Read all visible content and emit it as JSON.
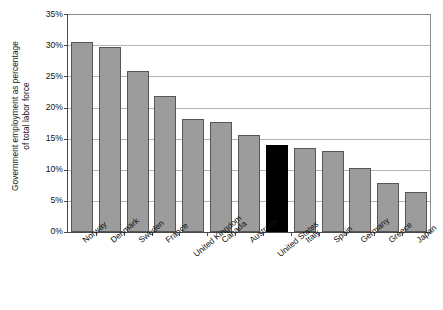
{
  "chart_data": {
    "type": "bar",
    "title": "",
    "subtitle": "",
    "xlabel": "",
    "ylabel": "Government employment as percentage\nof total labor force",
    "categories": [
      "Norway",
      "Denmark",
      "Sweden",
      "France",
      "United Kingdom",
      "Canada",
      "Australia",
      "United States",
      "Italy",
      "Spain",
      "Germany",
      "Greece",
      "Japan"
    ],
    "values": [
      30.6,
      29.8,
      26.0,
      22.0,
      18.3,
      17.8,
      15.7,
      14.0,
      13.5,
      13.0,
      10.4,
      7.9,
      6.4
    ],
    "value_labels": [
      "",
      "",
      "",
      "",
      "",
      "",
      "",
      "",
      "",
      "",
      "",
      "",
      ""
    ],
    "highlight_category": "United States",
    "series": [
      {
        "name": "Government employment as percentage of total labor force",
        "values": [
          30.6,
          29.8,
          26.0,
          22.0,
          18.3,
          17.8,
          15.7,
          14.0,
          13.5,
          13.0,
          10.4,
          7.9,
          6.4
        ]
      }
    ],
    "ylim": [
      0,
      35
    ],
    "ytick_values": [
      0,
      5,
      10,
      15,
      20,
      25,
      30,
      35
    ],
    "ytick_labels": [
      "0%",
      "5%",
      "10%",
      "15%",
      "20%",
      "25%",
      "30%",
      "35%"
    ],
    "grid": "horizontal",
    "legend": "none",
    "legend_position": "",
    "annotations": [],
    "colors": {
      "bar_fill": "#9c9c9c",
      "bar_border": "#565656",
      "highlight_fill": "#000000",
      "gridline": "#b4b4b4",
      "axis": "#4a4a4a",
      "background": "#ffffff",
      "text": "#111111"
    }
  }
}
